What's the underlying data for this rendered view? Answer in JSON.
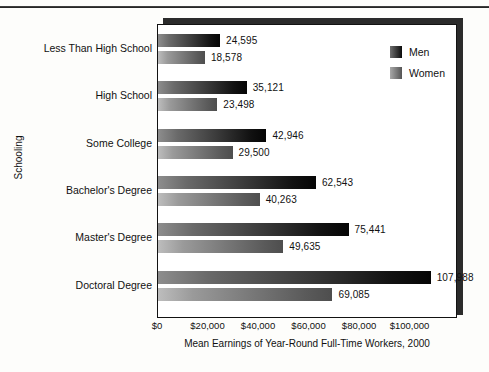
{
  "chart_data": {
    "type": "bar",
    "orientation": "horizontal",
    "title": "",
    "xlabel": "Mean Earnings of Year-Round Full-Time Workers, 2000",
    "ylabel": "Schooling",
    "categories": [
      "Less Than High School",
      "High School",
      "Some College",
      "Bachelor's Degree",
      "Master's Degree",
      "Doctoral Degree"
    ],
    "series": [
      {
        "name": "Men",
        "values": [
          24595,
          35121,
          42946,
          62543,
          75441,
          107988
        ],
        "labels": [
          "24,595",
          "35,121",
          "42,946",
          "62,543",
          "75,441",
          "107,988"
        ],
        "color": "#0b0b0b"
      },
      {
        "name": "Women",
        "values": [
          18578,
          23498,
          29500,
          40263,
          49635,
          69085
        ],
        "labels": [
          "18,578",
          "23,498",
          "29,500",
          "40,263",
          "49,635",
          "69,085"
        ],
        "color": "#555555"
      }
    ],
    "xlim": [
      0,
      118000
    ],
    "xticks": [
      0,
      20000,
      40000,
      60000,
      80000,
      100000
    ],
    "xticklabels": [
      "$0",
      "$20,000",
      "$40,000",
      "$60,000",
      "$80,000",
      "$100,000"
    ],
    "grid": false,
    "legend_position": "top-right"
  },
  "legend": {
    "items": [
      {
        "label": "Men"
      },
      {
        "label": "Women"
      }
    ]
  }
}
